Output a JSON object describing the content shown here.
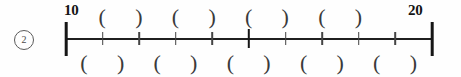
{
  "exercise": {
    "number_label": "2",
    "number_icon": "circled-number"
  },
  "numberline": {
    "start_label": "10",
    "end_label": "20",
    "start_value": 10,
    "end_value": 20,
    "divisions": 10,
    "tick_count_interior": 9,
    "major_tick_index": 5,
    "axis_color": "#1f1f1f",
    "tick_color": "#444444"
  },
  "slots": {
    "top": [
      {
        "mark": "(",
        "index": 0
      },
      {
        "mark": ")",
        "index": 1
      },
      {
        "mark": "(",
        "index": 2
      },
      {
        "mark": ")",
        "index": 3
      },
      {
        "mark": "(",
        "index": 4
      },
      {
        "mark": ")",
        "index": 5
      },
      {
        "mark": "(",
        "index": 6
      },
      {
        "mark": ")",
        "index": 7
      }
    ],
    "bottom": [
      {
        "mark": "(",
        "index": 0
      },
      {
        "mark": ")",
        "index": 1
      },
      {
        "mark": "(",
        "index": 2
      },
      {
        "mark": ")",
        "index": 3
      },
      {
        "mark": "(",
        "index": 4
      },
      {
        "mark": ")",
        "index": 5
      },
      {
        "mark": "(",
        "index": 6
      },
      {
        "mark": ")",
        "index": 7
      },
      {
        "mark": "(",
        "index": 8
      },
      {
        "mark": ")",
        "index": 9
      }
    ]
  },
  "layout": {
    "top_slot_x": [
      122,
      175,
      227,
      280,
      332,
      385,
      437,
      490
    ],
    "bottom_slot_x": [
      22,
      95,
      148,
      200,
      253,
      305,
      358,
      410,
      463,
      515
    ]
  }
}
